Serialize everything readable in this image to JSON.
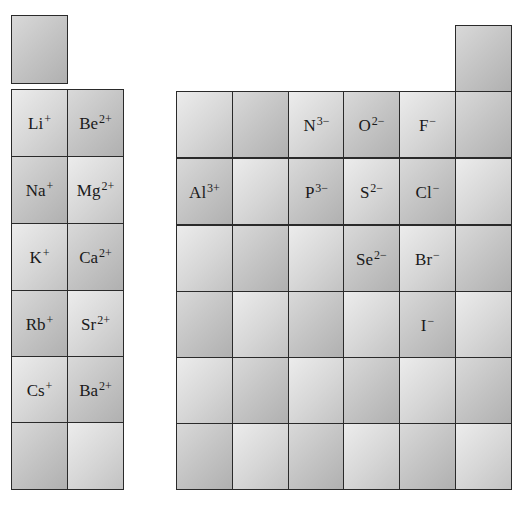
{
  "diagram": {
    "hydrogen_box": {
      "symbol": "",
      "charge": ""
    },
    "helium_box": {
      "symbol": "",
      "charge": ""
    },
    "left_block": {
      "columns": 2,
      "rows": [
        [
          {
            "symbol": "Li",
            "charge": "+"
          },
          {
            "symbol": "Be",
            "charge": "2+"
          }
        ],
        [
          {
            "symbol": "Na",
            "charge": "+"
          },
          {
            "symbol": "Mg",
            "charge": "2+"
          }
        ],
        [
          {
            "symbol": "K",
            "charge": "+"
          },
          {
            "symbol": "Ca",
            "charge": "2+"
          }
        ],
        [
          {
            "symbol": "Rb",
            "charge": "+"
          },
          {
            "symbol": "Sr",
            "charge": "2+"
          }
        ],
        [
          {
            "symbol": "Cs",
            "charge": "+"
          },
          {
            "symbol": "Ba",
            "charge": "2+"
          }
        ],
        [
          {
            "symbol": "",
            "charge": ""
          },
          {
            "symbol": "",
            "charge": ""
          }
        ]
      ]
    },
    "right_block": {
      "columns": 6,
      "rows": [
        [
          {
            "symbol": "",
            "charge": ""
          },
          {
            "symbol": "",
            "charge": ""
          },
          {
            "symbol": "N",
            "charge": "3−"
          },
          {
            "symbol": "O",
            "charge": "2−"
          },
          {
            "symbol": "F",
            "charge": "−"
          },
          {
            "symbol": "",
            "charge": ""
          }
        ],
        [
          {
            "symbol": "Al",
            "charge": "3+"
          },
          {
            "symbol": "",
            "charge": ""
          },
          {
            "symbol": "P",
            "charge": "3−"
          },
          {
            "symbol": "S",
            "charge": "2−"
          },
          {
            "symbol": "Cl",
            "charge": "−"
          },
          {
            "symbol": "",
            "charge": ""
          }
        ],
        [
          {
            "symbol": "",
            "charge": ""
          },
          {
            "symbol": "",
            "charge": ""
          },
          {
            "symbol": "",
            "charge": ""
          },
          {
            "symbol": "Se",
            "charge": "2−"
          },
          {
            "symbol": "Br",
            "charge": "−"
          },
          {
            "symbol": "",
            "charge": ""
          }
        ],
        [
          {
            "symbol": "",
            "charge": ""
          },
          {
            "symbol": "",
            "charge": ""
          },
          {
            "symbol": "",
            "charge": ""
          },
          {
            "symbol": "",
            "charge": ""
          },
          {
            "symbol": "I",
            "charge": "−"
          },
          {
            "symbol": "",
            "charge": ""
          }
        ],
        [
          {
            "symbol": "",
            "charge": ""
          },
          {
            "symbol": "",
            "charge": ""
          },
          {
            "symbol": "",
            "charge": ""
          },
          {
            "symbol": "",
            "charge": ""
          },
          {
            "symbol": "",
            "charge": ""
          },
          {
            "symbol": "",
            "charge": ""
          }
        ],
        [
          {
            "symbol": "",
            "charge": ""
          },
          {
            "symbol": "",
            "charge": ""
          },
          {
            "symbol": "",
            "charge": ""
          },
          {
            "symbol": "",
            "charge": ""
          },
          {
            "symbol": "",
            "charge": ""
          },
          {
            "symbol": "",
            "charge": ""
          }
        ]
      ]
    },
    "colors": {
      "border": "#2a2a2a",
      "cell_light": "#e6e6e6",
      "cell_dark": "#b9b9b9",
      "text": "#1a1a1a"
    }
  }
}
